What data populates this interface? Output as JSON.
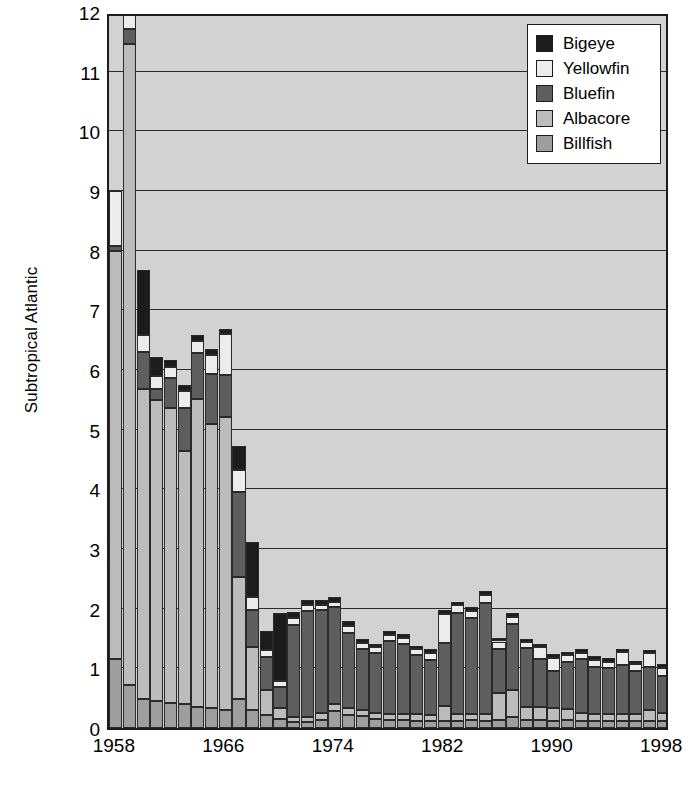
{
  "chart_data": {
    "type": "bar",
    "stacked": true,
    "title": "",
    "subtitle": "",
    "xlabel": "",
    "ylabel": "Subtropical Atlantic",
    "ylim": [
      0,
      12
    ],
    "ytick_labels": [
      "0",
      "1",
      "2",
      "3",
      "4",
      "5",
      "6",
      "7",
      "8",
      "9",
      "10",
      "11",
      "12"
    ],
    "yticks": [
      0,
      1,
      2,
      3,
      4,
      5,
      6,
      7,
      8,
      9,
      10,
      11,
      12
    ],
    "grid": true,
    "grid_axis": "y",
    "legend_position": "top-right",
    "xtick_labels": [
      "1958",
      "1966",
      "1974",
      "1982",
      "1990",
      "1998"
    ],
    "xticks": [
      1958,
      1966,
      1974,
      1982,
      1990,
      1998
    ],
    "x": [
      1958,
      1959,
      1960,
      1961,
      1962,
      1963,
      1964,
      1965,
      1966,
      1967,
      1968,
      1969,
      1970,
      1971,
      1972,
      1973,
      1974,
      1975,
      1976,
      1977,
      1978,
      1979,
      1980,
      1981,
      1982,
      1983,
      1984,
      1985,
      1986,
      1987,
      1988,
      1989,
      1990,
      1991,
      1992,
      1993,
      1994,
      1995,
      1996,
      1997,
      1998
    ],
    "series": [
      {
        "name": "Billfish",
        "color": "#9e9e9e",
        "values": [
          1.15,
          0.72,
          0.48,
          0.45,
          0.42,
          0.4,
          0.36,
          0.34,
          0.31,
          0.48,
          0.3,
          0.22,
          0.15,
          0.1,
          0.1,
          0.13,
          0.28,
          0.22,
          0.2,
          0.15,
          0.14,
          0.13,
          0.12,
          0.12,
          0.12,
          0.12,
          0.14,
          0.12,
          0.14,
          0.18,
          0.14,
          0.13,
          0.12,
          0.14,
          0.11,
          0.12,
          0.11,
          0.11,
          0.11,
          0.11,
          0.11
        ]
      },
      {
        "name": "Albacore",
        "color": "#bcbcbc",
        "values": [
          6.85,
          10.75,
          5.2,
          5.05,
          4.95,
          4.25,
          5.15,
          4.75,
          4.9,
          2.05,
          1.05,
          0.42,
          0.18,
          0.08,
          0.08,
          0.12,
          0.12,
          0.12,
          0.1,
          0.1,
          0.1,
          0.1,
          0.12,
          0.1,
          0.25,
          0.12,
          0.1,
          0.12,
          0.44,
          0.46,
          0.22,
          0.22,
          0.22,
          0.18,
          0.15,
          0.12,
          0.12,
          0.12,
          0.12,
          0.2,
          0.14
        ]
      },
      {
        "name": "Bluefin",
        "color": "#5e5e5e",
        "values": [
          0.08,
          0.25,
          0.62,
          0.18,
          0.5,
          0.72,
          0.78,
          0.84,
          0.7,
          1.42,
          0.62,
          0.55,
          0.35,
          1.55,
          1.78,
          1.72,
          1.62,
          1.25,
          1.03,
          1.0,
          1.22,
          1.18,
          0.98,
          0.92,
          1.06,
          1.68,
          1.6,
          1.85,
          0.75,
          1.1,
          0.98,
          0.8,
          0.62,
          0.78,
          0.9,
          0.78,
          0.78,
          0.82,
          0.72,
          0.72,
          0.62
        ]
      },
      {
        "name": "Yellowfin",
        "color": "#ececec",
        "values": [
          0.92,
          0.28,
          0.28,
          0.22,
          0.18,
          0.28,
          0.2,
          0.32,
          0.7,
          0.38,
          0.22,
          0.12,
          0.1,
          0.12,
          0.1,
          0.1,
          0.1,
          0.12,
          0.1,
          0.1,
          0.1,
          0.1,
          0.1,
          0.12,
          0.48,
          0.14,
          0.12,
          0.14,
          0.12,
          0.12,
          0.1,
          0.2,
          0.22,
          0.12,
          0.1,
          0.12,
          0.1,
          0.22,
          0.12,
          0.22,
          0.14
        ]
      },
      {
        "name": "Bigeye",
        "color": "#1c1c1c",
        "values": [
          0.0,
          0.0,
          1.1,
          0.32,
          0.12,
          0.1,
          0.1,
          0.1,
          0.08,
          0.4,
          0.92,
          0.32,
          1.15,
          0.1,
          0.08,
          0.08,
          0.08,
          0.08,
          0.06,
          0.06,
          0.06,
          0.06,
          0.06,
          0.06,
          0.06,
          0.06,
          0.06,
          0.06,
          0.06,
          0.06,
          0.06,
          0.06,
          0.06,
          0.06,
          0.06,
          0.06,
          0.06,
          0.06,
          0.06,
          0.06,
          0.06
        ]
      }
    ],
    "legend": [
      {
        "label": "Bigeye",
        "color": "#1c1c1c"
      },
      {
        "label": "Yellowfin",
        "color": "#ececec"
      },
      {
        "label": "Bluefin",
        "color": "#5e5e5e"
      },
      {
        "label": "Albacore",
        "color": "#bcbcbc"
      },
      {
        "label": "Billfish",
        "color": "#9e9e9e"
      }
    ],
    "stack_order_bottom_to_top": [
      "Billfish",
      "Albacore",
      "Bluefin",
      "Yellowfin",
      "Bigeye"
    ],
    "plot_background": "#d2d2d2",
    "frame_color": "#1c1c1c"
  }
}
